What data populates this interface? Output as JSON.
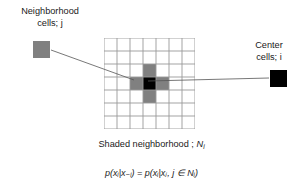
{
  "figure": {
    "background_color": "#ffffff",
    "text_color": "#1a1a1a"
  },
  "legend": {
    "neighborhood": {
      "line1": "Neighborhood",
      "line2": "cells; j",
      "swatch_color": "#808080",
      "swatch_label": "neighborhood-cell-swatch"
    },
    "center": {
      "line1": "Center",
      "line2": "cells; i",
      "swatch_color": "#000000",
      "swatch_label": "center-cell-swatch"
    }
  },
  "grid": {
    "columns": 7,
    "rows": 7,
    "cell_size": 13,
    "line_color": "#999999",
    "center_cell": {
      "col": 3,
      "row": 3,
      "color": "#000000"
    },
    "neighbor_cells": [
      {
        "col": 3,
        "row": 2,
        "color": "#808080"
      },
      {
        "col": 2,
        "row": 3,
        "color": "#808080"
      },
      {
        "col": 4,
        "row": 3,
        "color": "#808080"
      },
      {
        "col": 3,
        "row": 4,
        "color": "#808080"
      }
    ]
  },
  "leader_lines": [
    {
      "name": "neighborhood-leader-line",
      "x1": 51,
      "y1": 50,
      "x2": 134,
      "y2": 80
    },
    {
      "name": "center-leader-line",
      "x1": 269,
      "y1": 78,
      "x2": 148,
      "y2": 81
    }
  ],
  "caption": {
    "prefix": "Shaded neighborhood ; ",
    "symbol": "N",
    "subscript": "i"
  },
  "formula": {
    "text": "p(xᵢ|x₋ᵢ) = p(xᵢ|xⱼ, j ∈ Nᵢ)",
    "parts": {
      "p": "p",
      "left": "(x",
      "sub_i": "i",
      "bar": "|x",
      "sub_minus_i": "−i",
      "close": ")",
      "equals": "=",
      "sub_j": "j",
      "member": "j ∈ N",
      "sub_i2": "i"
    }
  }
}
